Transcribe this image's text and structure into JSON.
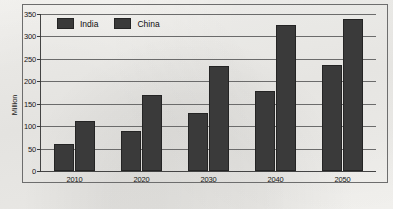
{
  "chart_data": {
    "type": "bar",
    "title": "",
    "xlabel": "",
    "ylabel": "Million",
    "categories": [
      "2010",
      "2020",
      "2030",
      "2040",
      "2050"
    ],
    "series": [
      {
        "name": "India",
        "values": [
          60,
          90,
          130,
          178,
          237
        ]
      },
      {
        "name": "China",
        "values": [
          112,
          170,
          235,
          325,
          340
        ]
      }
    ],
    "ylim": [
      0,
      350
    ],
    "ytick_labels": [
      "0",
      "50",
      "100",
      "150",
      "200",
      "250",
      "300",
      "350"
    ],
    "ytick_values": [
      0,
      50,
      100,
      150,
      200,
      250,
      300,
      350
    ],
    "grid": true,
    "legend_position": "top-left-inside",
    "colors": {
      "bar_fill": "#3a3a3a",
      "bar_edge": "#242424",
      "gridline": "#6b6b6b",
      "axis": "#444444",
      "frame": "#6d6d6d",
      "background": "#f2f1ee",
      "text": "#161616"
    }
  }
}
